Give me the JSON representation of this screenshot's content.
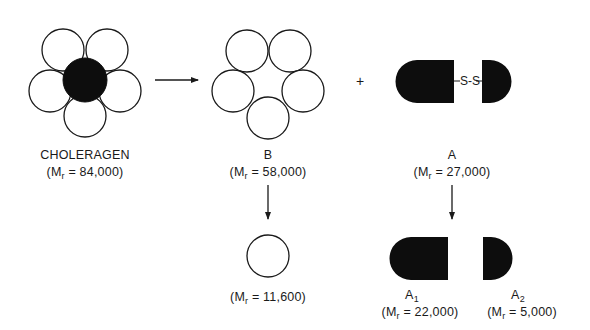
{
  "diagram": {
    "type": "cholera toxin subunit dissociation scheme",
    "operator_plus": "+",
    "disulfide_label": "S-S",
    "nodes": {
      "choleragen": {
        "name": "CHOLERAGEN",
        "mr_prefix": "(M",
        "mr_sub": "r",
        "mr_value": " = 84,000)"
      },
      "b": {
        "name": "B",
        "mr_prefix": "(M",
        "mr_sub": "r",
        "mr_value": " = 58,000)"
      },
      "a": {
        "name": "A",
        "mr_prefix": "(M",
        "mr_sub": "r",
        "mr_value": " = 27,000)"
      },
      "b_monomer": {
        "name": "",
        "mr_prefix": "(M",
        "mr_sub": "r",
        "mr_value": " = 11,600)"
      },
      "a1": {
        "name": "A",
        "name_sub": "1",
        "mr_prefix": "(M",
        "mr_sub": "r",
        "mr_value": " = 22,000)"
      },
      "a2": {
        "name": "A",
        "name_sub": "2",
        "mr_prefix": "(M",
        "mr_sub": "r",
        "mr_value": " = 5,000)"
      }
    },
    "edges": [
      {
        "from": "choleragen",
        "to": "b + a",
        "direction": "right"
      },
      {
        "from": "b",
        "to": "b_monomer",
        "direction": "down"
      },
      {
        "from": "a",
        "to": "a1 + a2",
        "direction": "down"
      }
    ],
    "colors": {
      "stroke": "#1a1a1a",
      "fill_dark": "#0d0d0d",
      "fill_light": "#ffffff"
    }
  }
}
